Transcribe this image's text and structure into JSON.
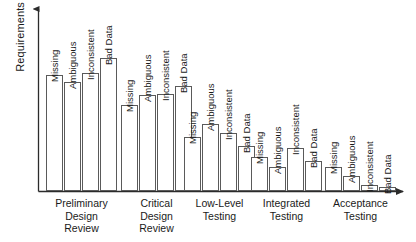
{
  "chart_data": {
    "type": "bar",
    "title": "",
    "xlabel": "",
    "ylabel": "Requirements Errors",
    "grid": false,
    "legend": "none",
    "axis_ticks": false,
    "axis_style": "arrow-axes",
    "categories": [
      "Preliminary Design Review",
      "Critical Design Review",
      "Low-Level Testing",
      "Integrated Testing",
      "Acceptance Testing"
    ],
    "bar_labels": [
      "Missing",
      "Ambiguous",
      "Inconsistent",
      "Bad Data"
    ],
    "groups": [
      {
        "name": "Preliminary Design Review",
        "name_lines": [
          "Preliminary",
          "Design",
          "Review"
        ],
        "bars": [
          {
            "label": "Missing",
            "value": 62
          },
          {
            "label": "Ambiguous",
            "value": 58
          },
          {
            "label": "Inconsistent",
            "value": 63
          },
          {
            "label": "Bad Data",
            "value": 71
          }
        ]
      },
      {
        "name": "Critical Design Review",
        "name_lines": [
          "Critical",
          "Design",
          "Review"
        ],
        "bars": [
          {
            "label": "Missing",
            "value": 46
          },
          {
            "label": "Ambiguous",
            "value": 51
          },
          {
            "label": "Inconsistent",
            "value": 52
          },
          {
            "label": "Bad Data",
            "value": 56
          }
        ]
      },
      {
        "name": "Low-Level Testing",
        "name_lines": [
          "Low-Level",
          "Testing"
        ],
        "bars": [
          {
            "label": "Missing",
            "value": 29
          },
          {
            "label": "Ambiguous",
            "value": 36
          },
          {
            "label": "Inconsistent",
            "value": 31
          },
          {
            "label": "Bad Data",
            "value": 24
          }
        ]
      },
      {
        "name": "Integrated Testing",
        "name_lines": [
          "Integrated",
          "Testing"
        ],
        "bars": [
          {
            "label": "Missing",
            "value": 18
          },
          {
            "label": "Ambiguous",
            "value": 13
          },
          {
            "label": "Inconsistent",
            "value": 23
          },
          {
            "label": "Bad Data",
            "value": 16
          }
        ]
      },
      {
        "name": "Acceptance Testing",
        "name_lines": [
          "Acceptance",
          "Testing"
        ],
        "bars": [
          {
            "label": "Missing",
            "value": 13
          },
          {
            "label": "Ambiguous",
            "value": 8
          },
          {
            "label": "Inconsistent",
            "value": 3
          },
          {
            "label": "Bad Data",
            "value": 2
          }
        ]
      }
    ],
    "ylim": [
      0,
      80
    ],
    "colors": {
      "bar_fill": "#ffffff",
      "bar_stroke": "#5a5a5a",
      "axis": "#2b2b2b",
      "text": "#1a1a1a"
    }
  },
  "layout": {
    "axis_x": 38,
    "axis_y_baseline": 191,
    "axis_top": 3,
    "axis_right": 410,
    "plot_height": 150,
    "bar_width": 17,
    "bar_gap": 1,
    "group_gap": 18,
    "group_starts": [
      46,
      121,
      184,
      251,
      325
    ]
  }
}
